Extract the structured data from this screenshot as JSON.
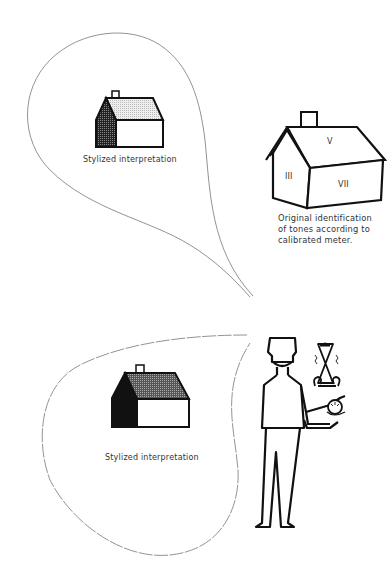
{
  "top_panel": {
    "bubble_label": "Stylized interpretation",
    "original_house": {
      "zones": [
        "V",
        "III",
        "VII"
      ],
      "caption_lines": [
        "Original identification",
        "of tones according to",
        "calibrated meter."
      ]
    }
  },
  "bottom_panel": {
    "bubble_label": "Stylized interpretation"
  },
  "colors": {
    "ink": "#111111",
    "paper": "#ffffff",
    "bubble_outline": "#777777",
    "light_hatch": "#d8d8d8",
    "dark_hatch": "#333333"
  }
}
